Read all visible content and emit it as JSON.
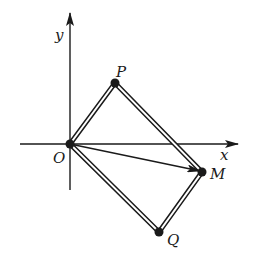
{
  "diagram": {
    "type": "coordinate-geometry",
    "colors": {
      "ink": "#1a1a1a",
      "background": "#ffffff"
    },
    "axes": {
      "x_label": "x",
      "y_label": "y",
      "origin_label": "O"
    },
    "points": [
      {
        "id": "O",
        "label": "O"
      },
      {
        "id": "P",
        "label": "P"
      },
      {
        "id": "M",
        "label": "M"
      },
      {
        "id": "Q",
        "label": "Q"
      }
    ],
    "shapes": [
      {
        "type": "rectangle",
        "vertices": [
          "O",
          "P",
          "M",
          "Q"
        ],
        "style": "double-line"
      },
      {
        "type": "vector",
        "from": "O",
        "to": "M"
      }
    ]
  }
}
